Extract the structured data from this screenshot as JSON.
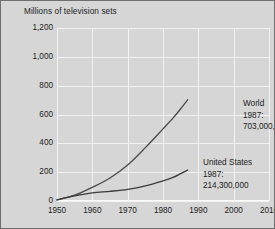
{
  "chart_data": {
    "type": "line",
    "title": "Millions of television sets",
    "xlabel": "",
    "ylabel": "",
    "xlim": [
      1950,
      2010
    ],
    "ylim": [
      0,
      1200
    ],
    "grid": true,
    "legend": "none",
    "xticks": [
      "1950",
      "1960",
      "1970",
      "1980",
      "1990",
      "2000",
      "2010"
    ],
    "yticks": [
      "0",
      "200",
      "400",
      "600",
      "800",
      "1,000",
      "1,200"
    ],
    "series": [
      {
        "name": "World",
        "color": "#4a4a4a",
        "x": [
          1950,
          1955,
          1960,
          1965,
          1970,
          1975,
          1980,
          1983,
          1985,
          1987
        ],
        "values": [
          8,
          40,
          95,
          160,
          250,
          370,
          500,
          580,
          640,
          703
        ]
      },
      {
        "name": "United States",
        "color": "#3a3a3a",
        "x": [
          1950,
          1955,
          1960,
          1965,
          1970,
          1975,
          1980,
          1983,
          1985,
          1987
        ],
        "values": [
          8,
          35,
          56,
          67,
          81,
          105,
          140,
          165,
          190,
          214
        ]
      }
    ],
    "annotations": [
      {
        "id": "world",
        "line1": "World",
        "line2": "1987:",
        "line3": "703,000,000"
      },
      {
        "id": "united-states",
        "line1": "United States",
        "line2": "1987:",
        "line3": "214,300,000"
      }
    ]
  },
  "colors": {
    "background": "#d6d6d6",
    "grid": "#f2f2f2",
    "text": "#1c1c1c",
    "border": "#6f6f6f"
  }
}
